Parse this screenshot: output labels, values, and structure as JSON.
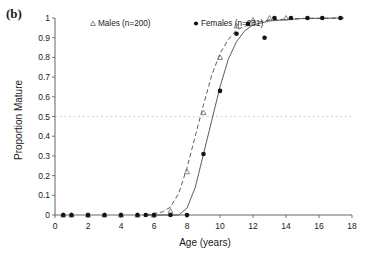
{
  "panel": {
    "label": "(b)"
  },
  "legend": {
    "position": "top-left-inside",
    "entries": [
      {
        "label": "Males (n=200)",
        "marker": "open-triangle",
        "line": "dashed"
      },
      {
        "label": "Females (n=231)",
        "marker": "filled-circle",
        "line": "solid"
      }
    ]
  },
  "chart_data": {
    "type": "scatter",
    "title": "",
    "xlabel": "Age (years)",
    "ylabel": "Proportion Mature",
    "xlim": [
      0,
      18
    ],
    "ylim": [
      0,
      1
    ],
    "xticks": [
      0,
      2,
      4,
      6,
      8,
      10,
      12,
      14,
      16,
      18
    ],
    "xticklabels": [
      "0",
      "2",
      "4",
      "6",
      "8",
      "10",
      "12",
      "14",
      "16",
      "18"
    ],
    "yticks": [
      0,
      0.1,
      0.2,
      0.3,
      0.4,
      0.5,
      0.6,
      0.7,
      0.8,
      0.9,
      1
    ],
    "yticklabels": [
      "0",
      "0.1",
      "0.2",
      "0.3",
      "0.4",
      "0.5",
      "0.6",
      "0.7",
      "0.8",
      "0.9",
      "1"
    ],
    "grid": false,
    "reference_lines": [
      {
        "orientation": "horizontal",
        "value": 0.5,
        "style": "dotted",
        "color": "#cfcfcf"
      }
    ],
    "series": [
      {
        "name": "Males (n=200)",
        "marker": "open-triangle",
        "line": "dashed",
        "color": "#4a4a4a",
        "points": [
          {
            "x": 0.5,
            "y": 0
          },
          {
            "x": 1.0,
            "y": 0
          },
          {
            "x": 2.0,
            "y": 0
          },
          {
            "x": 3.0,
            "y": 0
          },
          {
            "x": 4.0,
            "y": 0
          },
          {
            "x": 5.0,
            "y": 0
          },
          {
            "x": 6.0,
            "y": 0
          },
          {
            "x": 7.0,
            "y": 0.02
          },
          {
            "x": 8.0,
            "y": 0.22
          },
          {
            "x": 9.0,
            "y": 0.52
          },
          {
            "x": 10.0,
            "y": 0.8
          },
          {
            "x": 11.0,
            "y": 0.96
          },
          {
            "x": 12.0,
            "y": 0.99
          },
          {
            "x": 13.0,
            "y": 1.0
          },
          {
            "x": 14.0,
            "y": 1.0
          }
        ],
        "fit_curve": [
          {
            "x": 5.5,
            "y": 0.0
          },
          {
            "x": 6.5,
            "y": 0.015
          },
          {
            "x": 7.0,
            "y": 0.04
          },
          {
            "x": 7.5,
            "y": 0.11
          },
          {
            "x": 8.0,
            "y": 0.24
          },
          {
            "x": 8.5,
            "y": 0.4
          },
          {
            "x": 9.0,
            "y": 0.56
          },
          {
            "x": 9.5,
            "y": 0.71
          },
          {
            "x": 10.0,
            "y": 0.82
          },
          {
            "x": 10.5,
            "y": 0.89
          },
          {
            "x": 11.0,
            "y": 0.94
          },
          {
            "x": 12.0,
            "y": 0.975
          },
          {
            "x": 13.0,
            "y": 0.99
          },
          {
            "x": 15.0,
            "y": 0.998
          },
          {
            "x": 17.5,
            "y": 1.0
          }
        ]
      },
      {
        "name": "Females (n=231)",
        "marker": "filled-circle",
        "line": "solid",
        "color": "#141414",
        "points": [
          {
            "x": 0.5,
            "y": 0
          },
          {
            "x": 1.0,
            "y": 0
          },
          {
            "x": 2.0,
            "y": 0
          },
          {
            "x": 3.0,
            "y": 0
          },
          {
            "x": 4.0,
            "y": 0
          },
          {
            "x": 5.0,
            "y": 0
          },
          {
            "x": 5.5,
            "y": 0
          },
          {
            "x": 6.0,
            "y": 0
          },
          {
            "x": 7.0,
            "y": 0
          },
          {
            "x": 8.0,
            "y": 0
          },
          {
            "x": 9.0,
            "y": 0.31
          },
          {
            "x": 10.0,
            "y": 0.63
          },
          {
            "x": 11.0,
            "y": 0.92
          },
          {
            "x": 11.7,
            "y": 0.97
          },
          {
            "x": 12.7,
            "y": 0.9
          },
          {
            "x": 13.3,
            "y": 1.0
          },
          {
            "x": 14.3,
            "y": 1.0
          },
          {
            "x": 15.3,
            "y": 1.0
          },
          {
            "x": 16.2,
            "y": 1.0
          },
          {
            "x": 17.3,
            "y": 1.0
          }
        ],
        "fit_curve": [
          {
            "x": 5.5,
            "y": 0.0
          },
          {
            "x": 7.5,
            "y": 0.0
          },
          {
            "x": 8.0,
            "y": 0.035
          },
          {
            "x": 8.5,
            "y": 0.14
          },
          {
            "x": 9.0,
            "y": 0.31
          },
          {
            "x": 9.5,
            "y": 0.48
          },
          {
            "x": 10.0,
            "y": 0.65
          },
          {
            "x": 10.5,
            "y": 0.79
          },
          {
            "x": 11.0,
            "y": 0.88
          },
          {
            "x": 11.5,
            "y": 0.935
          },
          {
            "x": 12.0,
            "y": 0.965
          },
          {
            "x": 13.0,
            "y": 0.985
          },
          {
            "x": 15.0,
            "y": 0.997
          },
          {
            "x": 17.5,
            "y": 1.0
          }
        ]
      }
    ]
  }
}
